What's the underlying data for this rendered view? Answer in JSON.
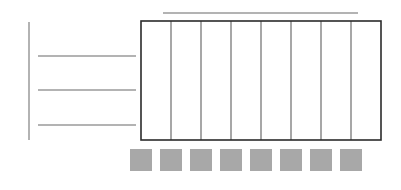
{
  "diagram": {
    "colors": {
      "frame": "#2b2b2b",
      "divider": "#8a8a8a",
      "rule": "#9a9a9a",
      "square": "#a8a8a8",
      "background": "#ffffff"
    },
    "top_rule": {
      "x1": 163,
      "x2": 358,
      "y": 13
    },
    "grid_box": {
      "x": 141,
      "y": 21,
      "width": 240,
      "height": 119,
      "columns": 8
    },
    "left_bracket": {
      "vertical": {
        "x": 29,
        "y1": 22,
        "y2": 140
      },
      "rules": [
        {
          "x1": 38,
          "x2": 136,
          "y": 56
        },
        {
          "x1": 38,
          "x2": 136,
          "y": 90
        },
        {
          "x1": 38,
          "x2": 136,
          "y": 125
        }
      ]
    },
    "squares": {
      "count": 8,
      "start_x": 130,
      "pitch": 30,
      "y": 149,
      "size": 22
    }
  }
}
